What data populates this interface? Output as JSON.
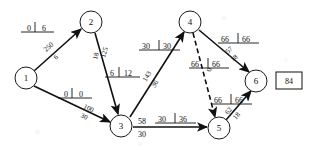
{
  "figure": {
    "type": "network-flow-diagram",
    "title": "",
    "total_box_value": "84"
  },
  "nodes": [
    {
      "id": "1",
      "label": "1",
      "x": 26,
      "y": 78,
      "r": 11
    },
    {
      "id": "2",
      "label": "2",
      "x": 91,
      "y": 22,
      "r": 11
    },
    {
      "id": "3",
      "label": "3",
      "x": 121,
      "y": 126,
      "r": 11
    },
    {
      "id": "4",
      "label": "4",
      "x": 190,
      "y": 22,
      "r": 11
    },
    {
      "id": "5",
      "label": "5",
      "x": 219,
      "y": 128,
      "r": 11
    },
    {
      "id": "6",
      "label": "6",
      "x": 256,
      "y": 81,
      "r": 11
    },
    {
      "id": "box",
      "label": "84",
      "x": 289,
      "y": 81,
      "r": 0
    }
  ],
  "edges": [
    {
      "from": "1",
      "to": "2",
      "style": "solid",
      "upper": "250",
      "lower": "6"
    },
    {
      "from": "2",
      "to": "3",
      "style": "solid",
      "upper": "125",
      "lower": "18"
    },
    {
      "from": "1",
      "to": "3",
      "style": "solid",
      "upper": "100",
      "lower": "30"
    },
    {
      "from": "3",
      "to": "4",
      "style": "solid",
      "upper": "143",
      "lower": "36"
    },
    {
      "from": "3",
      "to": "5",
      "style": "solid",
      "upper": "58",
      "lower": "30"
    },
    {
      "from": "4",
      "to": "5",
      "style": "dashed",
      "upper": "",
      "lower": "0"
    },
    {
      "from": "4",
      "to": "6",
      "style": "solid",
      "upper": "57",
      "lower": "18"
    },
    {
      "from": "5",
      "to": "6",
      "style": "solid",
      "upper": "62",
      "lower": "18"
    }
  ],
  "pair_labels": [
    {
      "id": "edge-1-2",
      "left": "0",
      "right": "6"
    },
    {
      "id": "edge-2-3",
      "left": "6",
      "right": "12"
    },
    {
      "id": "edge-1-3",
      "left": "0",
      "right": "0"
    },
    {
      "id": "edge-3-4",
      "left": "30",
      "right": "30"
    },
    {
      "id": "edge-4-5",
      "left": "66",
      "right": "66"
    },
    {
      "id": "edge-4-6",
      "left": "66",
      "right": "66"
    },
    {
      "id": "edge-5-6",
      "left": "66",
      "right": "66"
    },
    {
      "id": "edge-3-5",
      "left": "30",
      "right": "36"
    }
  ],
  "colors": {
    "ink": "#111111",
    "paper": "#ffffff"
  }
}
